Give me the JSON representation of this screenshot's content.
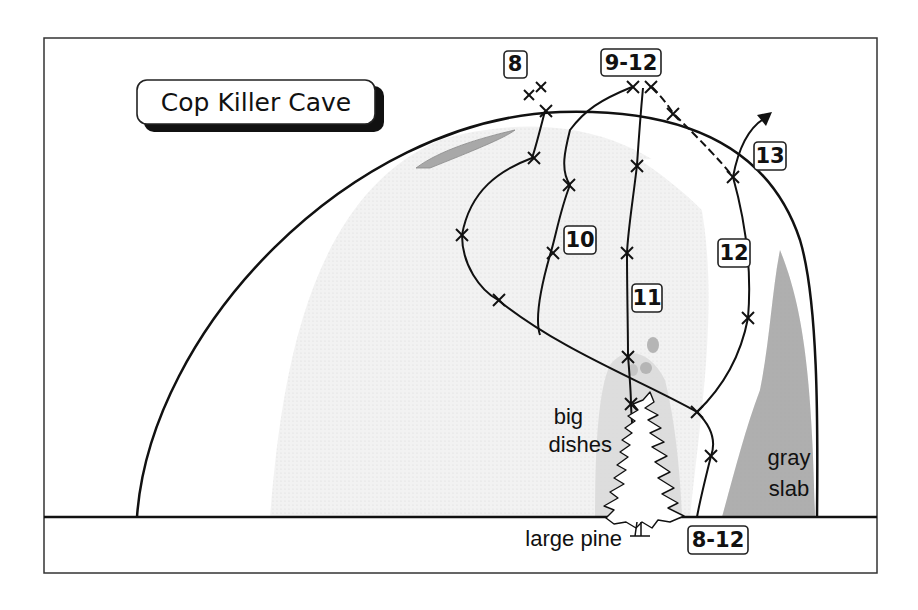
{
  "title": "Cop Killer Cave",
  "route_labels": [
    {
      "id": "8",
      "text": "8",
      "x": 515,
      "y": 64
    },
    {
      "id": "9-12",
      "text": "9-12",
      "x": 631,
      "y": 63
    },
    {
      "id": "13",
      "text": "13",
      "x": 770,
      "y": 156
    },
    {
      "id": "10",
      "text": "10",
      "x": 580,
      "y": 240
    },
    {
      "id": "11",
      "text": "11",
      "x": 647,
      "y": 298
    },
    {
      "id": "12",
      "text": "12",
      "x": 734,
      "y": 253
    },
    {
      "id": "8-12-start",
      "text": "8-12",
      "x": 718,
      "y": 540
    }
  ],
  "features": {
    "big_dishes_line1": "big",
    "big_dishes_line2": "dishes",
    "gray_slab_line1": "gray",
    "gray_slab_line2": "slab",
    "large_pine": "large pine"
  },
  "colors": {
    "background": "#ffffff",
    "rock_shading": "#eeeeee",
    "gray_slab": "#a3a3a3",
    "dish": "#b5b5b5",
    "line": "#111111"
  }
}
